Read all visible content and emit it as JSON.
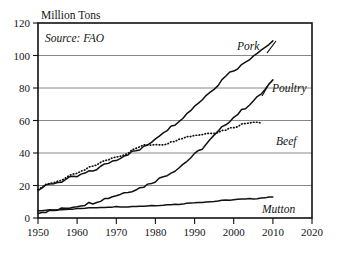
{
  "chart_data": {
    "type": "line",
    "title": "",
    "ylabel": "Million Tons",
    "xlabel": "",
    "annotation": "Source: FAO",
    "grid": true,
    "legend_position": "inline-right-labels",
    "xlim": [
      1950,
      2020
    ],
    "ylim": [
      0,
      120
    ],
    "yticks": [
      0,
      20,
      40,
      60,
      80,
      100,
      120
    ],
    "ytick_labels": [
      "0",
      "20",
      "40",
      "60",
      "80",
      "100",
      "120"
    ],
    "xticks": [
      1950,
      1960,
      1970,
      1980,
      1990,
      2000,
      2010,
      2020
    ],
    "xtick_labels": [
      "1950",
      "1960",
      "1970",
      "1980",
      "1990",
      "2000",
      "2010",
      "2020"
    ],
    "series": [
      {
        "name": "Pork",
        "label": "Pork",
        "style": "solid",
        "color": "#111111",
        "x": [
          1950,
          1952,
          1954,
          1956,
          1958,
          1960,
          1962,
          1964,
          1966,
          1968,
          1970,
          1972,
          1974,
          1976,
          1978,
          1980,
          1982,
          1984,
          1986,
          1988,
          1990,
          1992,
          1994,
          1996,
          1998,
          2000,
          2002,
          2004,
          2006,
          2008,
          2010
        ],
        "y": [
          17.5,
          19.5,
          21.5,
          22.5,
          24.5,
          25.5,
          27.5,
          29.0,
          31.5,
          34.0,
          36.0,
          38.5,
          40.5,
          42.0,
          45.0,
          49.0,
          53.0,
          56.0,
          60.0,
          64.0,
          69.0,
          73.0,
          78.0,
          82.0,
          88.0,
          91.0,
          94.0,
          98.0,
          102.0,
          105.0,
          109.0
        ]
      },
      {
        "name": "Poultry",
        "label": "Poultry",
        "style": "solid",
        "color": "#111111",
        "x": [
          1950,
          1952,
          1954,
          1956,
          1958,
          1960,
          1962,
          1964,
          1966,
          1968,
          1970,
          1972,
          1974,
          1976,
          1978,
          1980,
          1982,
          1984,
          1986,
          1988,
          1990,
          1992,
          1994,
          1996,
          1998,
          2000,
          2002,
          2004,
          2006,
          2008,
          2010
        ],
        "y": [
          3.5,
          4.0,
          4.5,
          5.5,
          6.5,
          7.5,
          8.5,
          9.5,
          11.0,
          12.5,
          14.0,
          15.5,
          17.0,
          18.5,
          20.5,
          23.0,
          25.5,
          28.0,
          31.0,
          35.0,
          39.0,
          43.0,
          48.0,
          53.0,
          58.0,
          62.0,
          66.0,
          70.0,
          74.0,
          79.0,
          85.0
        ]
      },
      {
        "name": "Beef",
        "label": "Beef",
        "style": "dotted",
        "color": "#111111",
        "x": [
          1950,
          1952,
          1954,
          1956,
          1958,
          1960,
          1962,
          1964,
          1966,
          1968,
          1970,
          1972,
          1974,
          1976,
          1978,
          1980,
          1982,
          1984,
          1986,
          1988,
          1990,
          1992,
          1994,
          1996,
          1998,
          2000,
          2002,
          2004,
          2006,
          2007
        ],
        "y": [
          18.0,
          20.0,
          22.0,
          23.5,
          25.5,
          27.5,
          29.5,
          32.0,
          34.0,
          36.0,
          38.0,
          39.0,
          41.5,
          44.0,
          45.0,
          45.5,
          45.5,
          46.5,
          49.0,
          50.0,
          51.0,
          51.5,
          52.5,
          53.0,
          54.5,
          56.0,
          57.5,
          59.0,
          59.5,
          58.5
        ]
      },
      {
        "name": "Mutton",
        "label": "Mutton",
        "style": "solid",
        "color": "#111111",
        "x": [
          1950,
          1954,
          1958,
          1962,
          1966,
          1970,
          1974,
          1978,
          1982,
          1986,
          1990,
          1994,
          1998,
          2002,
          2006,
          2010
        ],
        "y": [
          4.5,
          5.0,
          5.5,
          6.0,
          6.5,
          7.0,
          7.0,
          7.5,
          8.0,
          8.5,
          9.5,
          10.0,
          11.0,
          11.5,
          12.0,
          13.0
        ]
      }
    ]
  },
  "labels": {
    "pork": "Pork",
    "poultry": "Poultry",
    "beef": "Beef",
    "mutton": "Mutton",
    "axis_title": "Million Tons",
    "source": "Source: FAO"
  }
}
